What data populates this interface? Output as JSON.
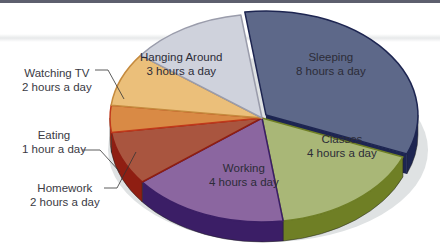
{
  "chart_data": {
    "type": "pie",
    "style": "3d-exploded-pie",
    "title": "",
    "unit": "hours a day",
    "total": 24,
    "slices": [
      {
        "name": "Sleeping",
        "value": 8,
        "label": "Sleeping",
        "sub": "8 hours a day",
        "color": "#5d6889",
        "side": "#1d2551"
      },
      {
        "name": "Classes",
        "value": 4,
        "label": "Classes",
        "sub": "4 hours a day",
        "color": "#a9b777",
        "side": "#6f7f25"
      },
      {
        "name": "Working",
        "value": 4,
        "label": "Working",
        "sub": "4 hours a day",
        "color": "#8b66a0",
        "side": "#3b1e66"
      },
      {
        "name": "Homework",
        "value": 2,
        "label": "Homework",
        "sub": "2 hours a day",
        "color": "#a9553f",
        "side": "#8f1e12"
      },
      {
        "name": "Eating",
        "value": 1,
        "label": "Eating",
        "sub": "1 hour a day",
        "color": "#d98a45",
        "side": "#c0391b"
      },
      {
        "name": "Watching TV",
        "value": 2,
        "label": "Watching TV",
        "sub": "2 hours a day",
        "color": "#ebbf7a",
        "side": "#c58a3d"
      },
      {
        "name": "Hanging Around",
        "value": 3,
        "label": "Hanging Around",
        "sub": "3 hours a day",
        "color": "#cfd2dc",
        "side": "#9a9cab"
      }
    ]
  },
  "labels": {
    "sleeping": {
      "title": "Sleeping",
      "sub": "8 hours a day"
    },
    "classes": {
      "title": "Classes",
      "sub": "4 hours a day"
    },
    "working": {
      "title": "Working",
      "sub": "4 hours a day"
    },
    "homework": {
      "title": "Homework",
      "sub": "2 hours a day"
    },
    "eating": {
      "title": "Eating",
      "sub": "1 hour a day"
    },
    "watching_tv": {
      "title": "Watching TV",
      "sub": "2 hours a day"
    },
    "hanging_around": {
      "title": "Hanging Around",
      "sub": "3 hours a day"
    }
  }
}
